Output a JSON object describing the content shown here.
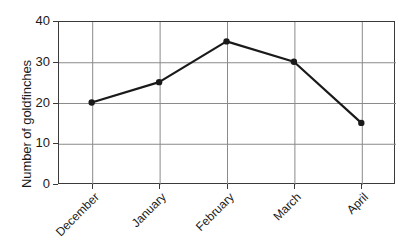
{
  "chart_data": {
    "type": "line",
    "title": "",
    "xlabel": "",
    "ylabel": "Number of goldfinches",
    "categories": [
      "December",
      "January",
      "February",
      "March",
      "April"
    ],
    "values": [
      20,
      25,
      35,
      30,
      15
    ],
    "series": [
      {
        "name": "Number of goldfinches",
        "values": [
          20,
          25,
          35,
          30,
          15
        ]
      }
    ],
    "ylim": [
      0,
      40
    ],
    "ytick_labels": [
      "0",
      "10",
      "20",
      "30",
      "40"
    ],
    "ytick_values": [
      0,
      10,
      20,
      30,
      40
    ],
    "grid": "horizontal-and-vertical",
    "legend": "none",
    "line_color": "#1a1a1a",
    "marker": "circle",
    "marker_color": "#1a1a1a",
    "grid_color": "#8a8a8a",
    "axis_color": "#3a3a3a",
    "background": "#ffffff",
    "xlabel_rotation": -45
  }
}
